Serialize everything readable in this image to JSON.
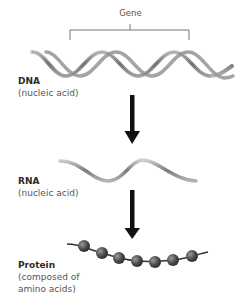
{
  "diagram": {
    "gene_label": "Gene",
    "stages": [
      {
        "id": "dna",
        "title": "DNA",
        "subtitle": "(nucleic acid)"
      },
      {
        "id": "rna",
        "title": "RNA",
        "subtitle": "(nucleic acid)"
      },
      {
        "id": "protein",
        "title": "Protein",
        "subtitle_line1": "(composed of",
        "subtitle_line2": "amino acids)"
      }
    ],
    "arrows": [
      {
        "from": "DNA",
        "to": "RNA"
      },
      {
        "from": "RNA",
        "to": "Protein"
      }
    ],
    "protein_bead_count": 7,
    "colors": {
      "strand": "#8a8a8a",
      "strand_light": "#c8c8c8",
      "arrow": "#111111",
      "bead": "#555555",
      "text": "#3a3a3a"
    }
  }
}
